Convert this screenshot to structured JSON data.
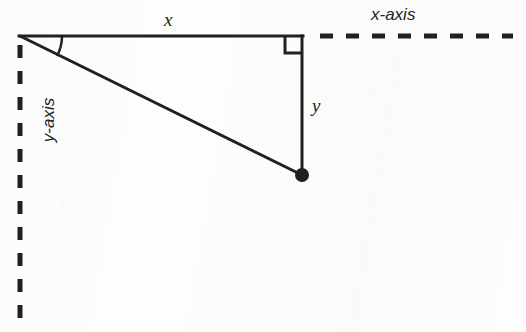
{
  "figure": {
    "kind": "geometry-diagram",
    "background_color": "#fdfdfd",
    "ink_color": "#231f20"
  },
  "labels": {
    "horizontal_leg": "x",
    "vertical_leg": "y",
    "x_axis": "x-axis",
    "y_axis": "y-axis"
  },
  "geometry": {
    "origin": {
      "x": 20,
      "y": 36
    },
    "corner": {
      "x": 302,
      "y": 36
    },
    "point": {
      "x": 302,
      "y": 175
    },
    "point_radius": 7,
    "right_angle_marker": {
      "x": 285,
      "y": 36,
      "size": 17
    },
    "angle_arc": {
      "cx": 20,
      "cy": 36,
      "radius": 42
    },
    "x_axis_dashed": {
      "x1": 320,
      "y1": 36,
      "x2": 513,
      "y2": 36
    },
    "y_axis_dashed": {
      "x1": 20,
      "y1": 45,
      "x2": 20,
      "y2": 323
    },
    "stroke_width": 3,
    "dash_pattern": "13 13"
  }
}
